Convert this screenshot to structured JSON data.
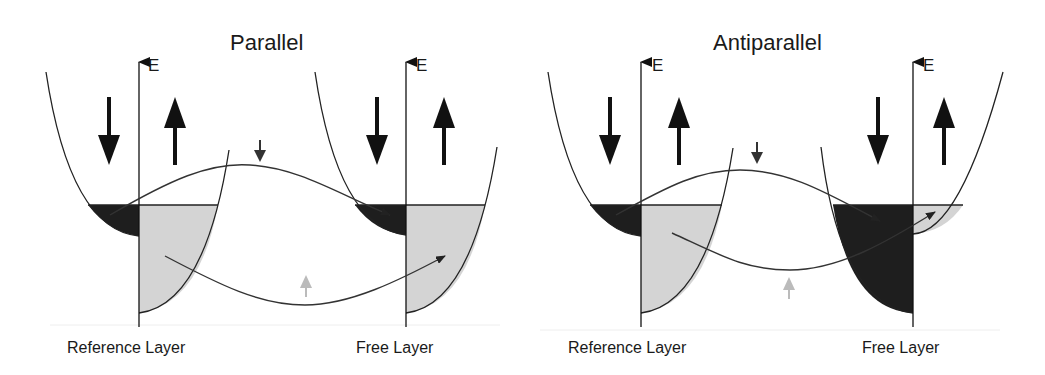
{
  "panels": [
    {
      "title": "Parallel",
      "axis_label_left": "E",
      "axis_label_right": "E",
      "left_layer_label": "Reference Layer",
      "right_layer_label": "Free Layer",
      "left_spins": [
        "down",
        "up"
      ],
      "right_spins": [
        "down",
        "up"
      ],
      "right_minority_filled": false
    },
    {
      "title": "Antiparallel",
      "axis_label_left": "E",
      "axis_label_right": "E",
      "left_layer_label": "Reference Layer",
      "right_layer_label": "Free Layer",
      "left_spins": [
        "down",
        "up"
      ],
      "right_spins": [
        "down",
        "up"
      ],
      "right_minority_filled": true
    }
  ],
  "colors": {
    "line": "#222222",
    "dark_fill": "#1e1e1e",
    "light_fill": "#d4d4d4",
    "faint_arrow": "#b8b8b8"
  }
}
